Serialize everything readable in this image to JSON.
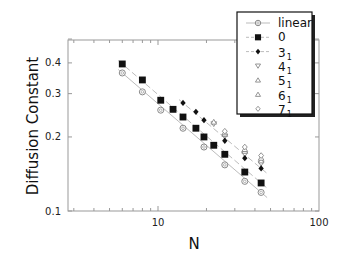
{
  "chart_data": {
    "type": "scatter",
    "title": "",
    "xlabel": "N",
    "ylabel": "Diffusion Constant",
    "xscale": "log",
    "yscale": "log",
    "xlim": [
      2.8,
      100
    ],
    "ylim": [
      0.1,
      0.5
    ],
    "x_ticks": [
      {
        "value": 10,
        "label": "10"
      },
      {
        "value": 100,
        "label": "100"
      }
    ],
    "y_ticks": [
      {
        "value": 0.1,
        "label": "0.1"
      },
      {
        "value": 0.2,
        "label": "0.2"
      },
      {
        "value": 0.3,
        "label": "0.3"
      },
      {
        "value": 0.4,
        "label": "0.4"
      }
    ],
    "grid": false,
    "legend_position": "top-right (overlapping frame)",
    "series": [
      {
        "name": "linear",
        "label_main": "linear",
        "label_sub": "",
        "marker": "open-circle",
        "line": "solid-thin",
        "x": [
          6,
          8,
          10.4,
          14.3,
          19.3,
          26,
          34.6,
          43.7
        ],
        "y": [
          0.364,
          0.305,
          0.257,
          0.217,
          0.182,
          0.154,
          0.132,
          0.119
        ]
      },
      {
        "name": "0",
        "label_main": "0",
        "label_sub": "",
        "marker": "filled-square",
        "line": "dashed",
        "x": [
          6,
          8,
          10.4,
          12.4,
          14.3,
          17.2,
          19.3,
          22.2,
          26,
          34.6,
          43.7
        ],
        "y": [
          0.396,
          0.341,
          0.282,
          0.259,
          0.241,
          0.217,
          0.2,
          0.185,
          0.17,
          0.144,
          0.13
        ]
      },
      {
        "name": "3_1",
        "label_main": "3",
        "label_sub": "1",
        "marker": "filled-diamond",
        "line": "dashed",
        "x": [
          14.3,
          17.2,
          19.3,
          26,
          34.6,
          43.7
        ],
        "y": [
          0.275,
          0.253,
          0.234,
          0.193,
          0.164,
          0.149
        ]
      },
      {
        "name": "4_1",
        "label_main": "4",
        "label_sub": "1",
        "marker": "open-triangle-down",
        "line": "none",
        "x": [
          22.2,
          26,
          34.6,
          43.7
        ],
        "y": [
          0.226,
          0.201,
          0.17,
          0.156
        ]
      },
      {
        "name": "5_1",
        "label_main": "5",
        "label_sub": "1",
        "marker": "open-triangle-up",
        "line": "none",
        "x": [
          22.2,
          26,
          34.6,
          43.7
        ],
        "y": [
          0.23,
          0.205,
          0.175,
          0.16
        ]
      },
      {
        "name": "6_1",
        "label_main": "6",
        "label_sub": "1",
        "marker": "open-triangle-up",
        "line": "none",
        "x": [
          26,
          34.6,
          43.7
        ],
        "y": [
          0.208,
          0.178,
          0.164
        ]
      },
      {
        "name": "7_1",
        "label_main": "7",
        "label_sub": "1",
        "marker": "open-diamond",
        "line": "none",
        "x": [
          26,
          34.6,
          43.7
        ],
        "y": [
          0.211,
          0.182,
          0.168
        ]
      }
    ]
  },
  "colors": {
    "axis": "#999999",
    "marker_fill": "#111111",
    "open_marker_stroke": "#888888",
    "legend_border": "#111111"
  }
}
